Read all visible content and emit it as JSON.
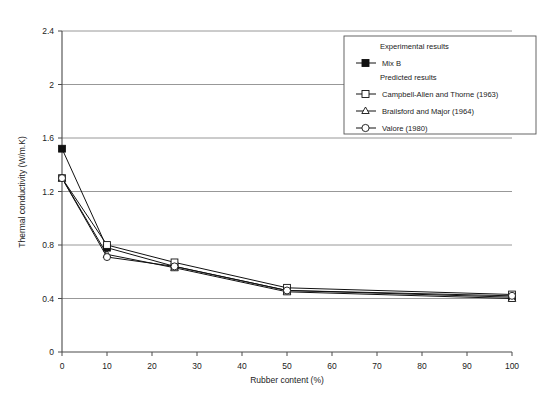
{
  "chart_data": {
    "type": "line",
    "title": "",
    "xlabel": "Rubber content (%)",
    "ylabel": "Thermal conductivity (W/m.K)",
    "xlim": [
      0,
      100
    ],
    "ylim": [
      0,
      2.4
    ],
    "xticks": [
      "0",
      "10",
      "20",
      "30",
      "40",
      "50",
      "60",
      "70",
      "80",
      "90",
      "100"
    ],
    "yticks": [
      "0",
      "0.4",
      "0.8",
      "1.2",
      "1.6",
      "2",
      "2.4"
    ],
    "grid": "horizontal",
    "legend_position": "top-right",
    "x": [
      0,
      10,
      25,
      50,
      100
    ],
    "series": [
      {
        "name": "Mix B",
        "group": "Experimental results",
        "marker": "filled-square",
        "values": [
          1.52,
          0.78,
          0.64,
          0.46,
          0.41
        ]
      },
      {
        "name": "Campbell-Allen and Thorne (1963)",
        "group": "Predicted results",
        "marker": "open-square",
        "values": [
          1.3,
          0.8,
          0.67,
          0.48,
          0.43
        ]
      },
      {
        "name": "Brailsford and Major (1964)",
        "group": "Predicted results",
        "marker": "open-triangle",
        "values": [
          1.3,
          0.73,
          0.63,
          0.45,
          0.4
        ]
      },
      {
        "name": "Valore (1980)",
        "group": "Predicted results",
        "marker": "open-circle",
        "values": [
          1.3,
          0.71,
          0.64,
          0.46,
          0.42
        ]
      }
    ]
  },
  "legend": {
    "heading_experimental": "Experimental results",
    "heading_predicted": "Predicted results",
    "entries": [
      "Mix B",
      "Campbell-Allen and Thorne (1963)",
      "Brailsford and Major (1964)",
      "Valore (1980)"
    ]
  },
  "colors": {
    "line": "#111111",
    "grid": "#7d7d7d",
    "frame": "#4a4a4a",
    "background": "#ffffff"
  }
}
